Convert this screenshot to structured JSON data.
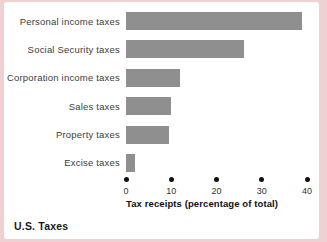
{
  "frame": {
    "border_color": "#f0d0d0",
    "panel_color": "#ffffff"
  },
  "chart_data": {
    "type": "bar",
    "orientation": "horizontal",
    "title": "U.S. Taxes",
    "categories": [
      "Personal income taxes",
      "Social Security taxes",
      "Corporation income taxes",
      "Sales taxes",
      "Property taxes",
      "Excise taxes"
    ],
    "values": [
      39,
      26,
      12,
      10,
      9.5,
      2
    ],
    "xlabel": "Tax receipts (percentage of total)",
    "xlim": [
      0,
      40
    ],
    "xticks": [
      0,
      10,
      20,
      30,
      40
    ],
    "bar_color": "#8f8f8f",
    "tick_dot_color": "#111111",
    "grid": false,
    "legend": false
  },
  "caption": {
    "text": "U.S. Taxes"
  }
}
